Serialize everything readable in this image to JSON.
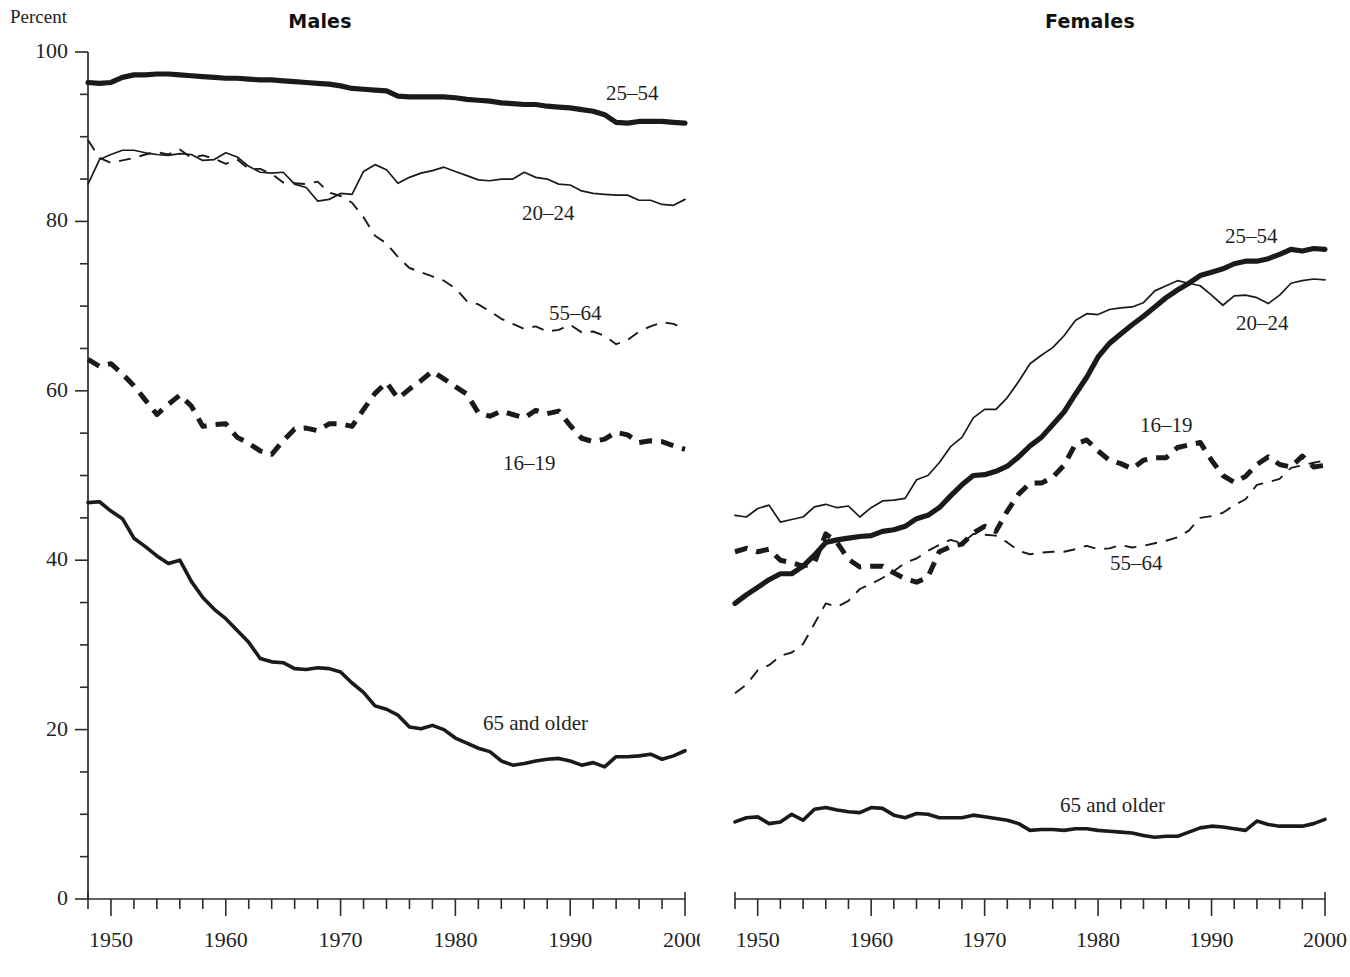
{
  "figure": {
    "percent_axis_label": "Percent"
  },
  "panels": [
    {
      "id": "males",
      "title": "Males",
      "series_labels": {
        "a2554": "25–54",
        "a2024": "20–24",
        "a5564": "55–64",
        "a1619": "16–19",
        "a65": "65 and older"
      }
    },
    {
      "id": "females",
      "title": "Females",
      "series_labels": {
        "a2554": "25–54",
        "a2024": "20–24",
        "a5564": "55–64",
        "a1619": "16–19",
        "a65": "65 and older"
      }
    }
  ],
  "axes": {
    "y_ticks": [
      0,
      20,
      40,
      60,
      80,
      100
    ],
    "y_minor_step": 5,
    "ylim": [
      0,
      100
    ],
    "x_ticks": [
      1950,
      1960,
      1970,
      1980,
      1990,
      2000
    ],
    "x_minor_step": 2,
    "xlim": [
      1948,
      2000
    ]
  },
  "chart_data": {
    "type": "line",
    "xlabel": "",
    "ylabel": "Percent",
    "ylim": [
      0,
      100
    ],
    "xlim": [
      1948,
      2000
    ],
    "grid": false,
    "legend_position": "inline-annotations",
    "x": [
      1948,
      1949,
      1950,
      1951,
      1952,
      1953,
      1954,
      1955,
      1956,
      1957,
      1958,
      1959,
      1960,
      1961,
      1962,
      1963,
      1964,
      1965,
      1966,
      1967,
      1968,
      1969,
      1970,
      1971,
      1972,
      1973,
      1974,
      1975,
      1976,
      1977,
      1978,
      1979,
      1980,
      1981,
      1982,
      1983,
      1984,
      1985,
      1986,
      1987,
      1988,
      1989,
      1990,
      1991,
      1992,
      1993,
      1994,
      1995,
      1996,
      1997,
      1998,
      1999,
      2000
    ],
    "panels": [
      {
        "name": "Males",
        "series": [
          {
            "name": "25–54",
            "style": "thick-solid",
            "values": [
              96.4,
              96.3,
              96.4,
              97.0,
              97.3,
              97.3,
              97.4,
              97.4,
              97.3,
              97.2,
              97.1,
              97.0,
              96.9,
              96.9,
              96.8,
              96.7,
              96.7,
              96.6,
              96.5,
              96.4,
              96.3,
              96.2,
              96.0,
              95.7,
              95.6,
              95.5,
              95.4,
              94.8,
              94.7,
              94.7,
              94.7,
              94.7,
              94.6,
              94.4,
              94.3,
              94.2,
              94.0,
              93.9,
              93.8,
              93.8,
              93.6,
              93.5,
              93.4,
              93.2,
              93.0,
              92.6,
              91.7,
              91.6,
              91.8,
              91.8,
              91.8,
              91.7,
              91.6
            ]
          },
          {
            "name": "20–24",
            "style": "thin-solid",
            "values": [
              84.4,
              87.3,
              87.9,
              88.4,
              88.4,
              88.1,
              87.9,
              87.8,
              88.0,
              87.9,
              87.2,
              87.3,
              88.1,
              87.6,
              86.5,
              85.8,
              85.7,
              85.8,
              84.4,
              84.0,
              82.4,
              82.6,
              83.3,
              83.2,
              85.9,
              86.7,
              86.1,
              84.5,
              85.2,
              85.7,
              86.0,
              86.4,
              85.9,
              85.4,
              84.9,
              84.8,
              85.0,
              85.0,
              85.8,
              85.2,
              85.0,
              84.4,
              84.3,
              83.6,
              83.3,
              83.2,
              83.1,
              83.1,
              82.5,
              82.5,
              82.0,
              81.9,
              82.6
            ]
          },
          {
            "name": "55–64",
            "style": "thin-dashed",
            "values": [
              89.6,
              87.5,
              86.9,
              87.2,
              87.5,
              87.9,
              88.2,
              87.9,
              88.5,
              87.5,
              87.8,
              87.4,
              86.8,
              87.3,
              86.2,
              86.2,
              85.6,
              84.6,
              84.5,
              84.4,
              84.7,
              83.4,
              83.0,
              82.2,
              80.5,
              78.3,
              77.4,
              75.8,
              74.5,
              74.0,
              73.5,
              73.0,
              72.1,
              70.6,
              70.2,
              69.4,
              68.5,
              67.9,
              67.3,
              67.6,
              67.0,
              67.2,
              67.8,
              66.9,
              67.0,
              66.5,
              65.5,
              66.0,
              67.0,
              67.6,
              68.1,
              67.9,
              67.3
            ]
          },
          {
            "name": "16–19",
            "style": "thick-dashed",
            "values": [
              63.7,
              62.9,
              63.2,
              62.0,
              60.6,
              58.9,
              57.2,
              58.4,
              59.5,
              58.2,
              55.8,
              56.0,
              56.1,
              54.5,
              53.8,
              52.9,
              52.5,
              54.1,
              55.5,
              55.6,
              55.3,
              56.1,
              56.1,
              55.8,
              57.8,
              59.7,
              61.0,
              59.1,
              60.2,
              61.2,
              62.3,
              61.4,
              60.5,
              59.6,
              57.4,
              57.0,
              57.6,
              57.2,
              56.8,
              57.7,
              57.3,
              57.6,
              55.9,
              54.4,
              54.0,
              54.3,
              55.1,
              54.8,
              53.9,
              54.1,
              54.0,
              53.5,
              53.1
            ]
          },
          {
            "name": "65 and older",
            "style": "medium-solid",
            "values": [
              46.8,
              46.9,
              45.8,
              44.9,
              42.6,
              41.6,
              40.5,
              39.6,
              40.0,
              37.5,
              35.6,
              34.2,
              33.1,
              31.7,
              30.3,
              28.4,
              28.0,
              27.9,
              27.2,
              27.1,
              27.3,
              27.2,
              26.8,
              25.5,
              24.4,
              22.8,
              22.4,
              21.7,
              20.3,
              20.1,
              20.5,
              20.0,
              19.0,
              18.4,
              17.8,
              17.4,
              16.3,
              15.8,
              16.0,
              16.3,
              16.5,
              16.6,
              16.3,
              15.8,
              16.1,
              15.6,
              16.8,
              16.8,
              16.9,
              17.1,
              16.5,
              16.9,
              17.5
            ]
          }
        ]
      },
      {
        "name": "Females",
        "series": [
          {
            "name": "25–54",
            "style": "thick-solid",
            "values": [
              34.9,
              35.9,
              36.8,
              37.7,
              38.4,
              38.4,
              39.3,
              40.6,
              42.1,
              42.4,
              42.6,
              42.8,
              42.9,
              43.4,
              43.6,
              44.0,
              44.9,
              45.3,
              46.2,
              47.6,
              48.9,
              50.0,
              50.1,
              50.5,
              51.1,
              52.2,
              53.5,
              54.5,
              56.0,
              57.5,
              59.6,
              61.6,
              64.0,
              65.6,
              66.7,
              67.8,
              68.8,
              69.9,
              71.0,
              71.9,
              72.7,
              73.6,
              74.0,
              74.4,
              75.0,
              75.3,
              75.3,
              75.6,
              76.1,
              76.7,
              76.5,
              76.8,
              76.7
            ]
          },
          {
            "name": "20–24",
            "style": "thin-solid",
            "values": [
              45.3,
              45.1,
              46.1,
              46.5,
              44.5,
              44.8,
              45.1,
              46.3,
              46.6,
              46.2,
              46.4,
              45.1,
              46.2,
              47.0,
              47.1,
              47.3,
              49.5,
              50.0,
              51.5,
              53.4,
              54.5,
              56.8,
              57.8,
              57.8,
              59.2,
              61.1,
              63.2,
              64.2,
              65.1,
              66.5,
              68.3,
              69.1,
              69.0,
              69.6,
              69.8,
              69.9,
              70.4,
              71.8,
              72.4,
              73.0,
              72.7,
              72.4,
              71.3,
              70.1,
              71.2,
              71.3,
              71.0,
              70.3,
              71.3,
              72.7,
              73.0,
              73.2,
              73.1
            ]
          },
          {
            "name": "55–64",
            "style": "thin-dashed",
            "values": [
              24.3,
              25.3,
              27.0,
              27.6,
              28.7,
              29.1,
              30.1,
              32.5,
              34.9,
              34.5,
              35.2,
              36.6,
              37.2,
              37.9,
              38.7,
              39.7,
              40.2,
              41.1,
              41.8,
              42.4,
              42.0,
              43.1,
              43.0,
              42.9,
              42.1,
              41.1,
              40.7,
              40.9,
              41.0,
              41.0,
              41.3,
              41.7,
              41.3,
              41.4,
              41.8,
              41.5,
              41.7,
              42.0,
              42.3,
              42.7,
              43.5,
              45.0,
              45.2,
              45.6,
              46.5,
              47.2,
              48.9,
              49.2,
              49.6,
              50.9,
              51.2,
              51.5,
              51.8
            ]
          },
          {
            "name": "16–19",
            "style": "thick-dashed",
            "values": [
              41.0,
              41.4,
              41.0,
              41.3,
              40.0,
              39.7,
              39.3,
              39.7,
              43.1,
              42.1,
              40.1,
              39.2,
              39.3,
              39.3,
              38.5,
              37.8,
              37.4,
              38.0,
              41.0,
              41.6,
              41.9,
              43.2,
              44.0,
              43.4,
              45.8,
              47.8,
              49.1,
              49.1,
              49.8,
              51.2,
              53.7,
              54.2,
              52.9,
              51.8,
              51.4,
              50.8,
              51.8,
              52.1,
              52.1,
              53.3,
              53.6,
              53.9,
              51.8,
              50.0,
              49.2,
              49.9,
              51.3,
              52.2,
              51.3,
              51.0,
              52.3,
              51.0,
              51.2
            ]
          },
          {
            "name": "65 and older",
            "style": "medium-solid",
            "values": [
              9.1,
              9.6,
              9.7,
              8.9,
              9.1,
              10.0,
              9.3,
              10.6,
              10.8,
              10.5,
              10.3,
              10.2,
              10.8,
              10.7,
              9.9,
              9.6,
              10.1,
              10.0,
              9.6,
              9.6,
              9.6,
              9.9,
              9.7,
              9.5,
              9.3,
              8.9,
              8.1,
              8.2,
              8.2,
              8.1,
              8.3,
              8.3,
              8.1,
              8.0,
              7.9,
              7.8,
              7.5,
              7.3,
              7.4,
              7.4,
              7.9,
              8.4,
              8.6,
              8.5,
              8.3,
              8.1,
              9.2,
              8.8,
              8.6,
              8.6,
              8.6,
              8.9,
              9.4
            ]
          }
        ]
      }
    ]
  }
}
